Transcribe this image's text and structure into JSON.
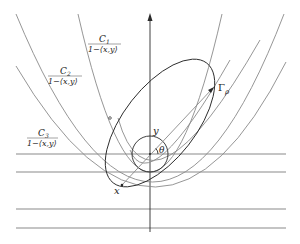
{
  "diagram": {
    "axis": {
      "label": "",
      "direction": "up"
    },
    "labels": {
      "c1_num": "C",
      "c1_sub": "1",
      "c1_den": "1−⟨x,y⟩",
      "c2_num": "C",
      "c2_sub": "2",
      "c2_den": "1−⟨x,y⟩",
      "c3_num": "C",
      "c3_sub": "3",
      "c3_den": "1−⟨x,y⟩",
      "gamma": "Γ",
      "gamma_sub": "ρ",
      "y": "y",
      "x": "x",
      "theta": "θ"
    },
    "horizontal_lines_y": [
      154,
      172,
      209,
      228
    ],
    "colors": {
      "dark": "#2a2a2a",
      "gray": "#8a8a8a",
      "background": "#ffffff"
    }
  }
}
